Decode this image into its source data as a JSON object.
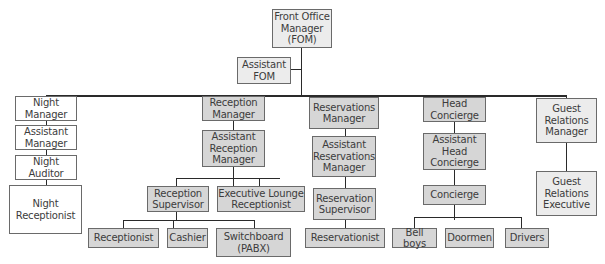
{
  "diagram": {
    "type": "org-chart",
    "root": {
      "label": "Front Office\nManager\n(FOM)"
    },
    "staff": {
      "label": "Assistant\nFOM"
    },
    "columns": [
      {
        "name": "night",
        "boxes": [
          {
            "label": "Night\nManager"
          },
          {
            "label": "Assistant\nManager"
          },
          {
            "label": "Night\nAuditor"
          },
          {
            "label": "Night\nReceptionist"
          }
        ]
      },
      {
        "name": "reception",
        "boxes": [
          {
            "label": "Reception\nManager"
          },
          {
            "label": "Assistant\nReception\nManager"
          }
        ],
        "sub": [
          {
            "label": "Reception\nSupervisor"
          },
          {
            "label": "Executive Lounge\nReceptionist"
          }
        ],
        "leaves": [
          {
            "label": "Receptionist"
          },
          {
            "label": "Cashier"
          },
          {
            "label": "Switchboard\n(PABX)"
          }
        ]
      },
      {
        "name": "reservations",
        "boxes": [
          {
            "label": "Reservations\nManager"
          },
          {
            "label": "Assistant\nReservations\nManager"
          },
          {
            "label": "Reservation\nSupervisor"
          },
          {
            "label": "Reservationist"
          }
        ]
      },
      {
        "name": "concierge",
        "boxes": [
          {
            "label": "Head\nConcierge"
          },
          {
            "label": "Assistant\nHead\nConcierge"
          },
          {
            "label": "Concierge"
          }
        ],
        "leaves": [
          {
            "label": "Bell boys"
          },
          {
            "label": "Doormen"
          },
          {
            "label": "Drivers"
          }
        ]
      },
      {
        "name": "guest-relations",
        "boxes": [
          {
            "label": "Guest\nRelations\nManager"
          },
          {
            "label": "Guest\nRelations\nExecutive"
          }
        ]
      }
    ],
    "colors": {
      "dark_box": "#d6d6d6",
      "light_box": "#ececec",
      "white_box": "#ffffff",
      "border": "#6a6a6a",
      "line": "#2a2a2a",
      "text": "#3c3c3c"
    }
  }
}
